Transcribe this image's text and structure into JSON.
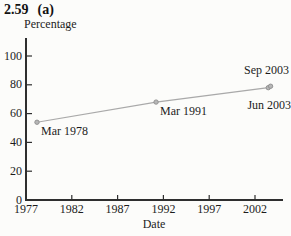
{
  "figure": {
    "number": "2.59",
    "part": "(a)"
  },
  "chart_data": {
    "type": "line",
    "title": "",
    "xlabel": "Date",
    "ylabel": "Percentage",
    "x_ticks": [
      1977,
      1982,
      1987,
      1992,
      1997,
      2002
    ],
    "y_ticks": [
      0,
      20,
      40,
      60,
      80,
      100
    ],
    "xlim": [
      1977,
      2005
    ],
    "ylim": [
      0,
      112
    ],
    "grid": false,
    "legend": "none",
    "line_color": "#a9a9a9",
    "marker_fill": "#b6b6b6",
    "marker_stroke": "#8d8d8d",
    "axis_color": "#2e2e2e",
    "series": [
      {
        "name": "Percentage",
        "points": [
          {
            "label": "Mar 1978",
            "x": 1978.2,
            "y": 54,
            "label_placement": "below-right"
          },
          {
            "label": "Mar 1991",
            "x": 1991.2,
            "y": 68,
            "label_placement": "below-right"
          },
          {
            "label": "Jun 2003",
            "x": 2003.45,
            "y": 78,
            "label_placement": "below"
          },
          {
            "label": "Sep 2003",
            "x": 2003.7,
            "y": 79,
            "label_placement": "above"
          }
        ]
      }
    ]
  }
}
